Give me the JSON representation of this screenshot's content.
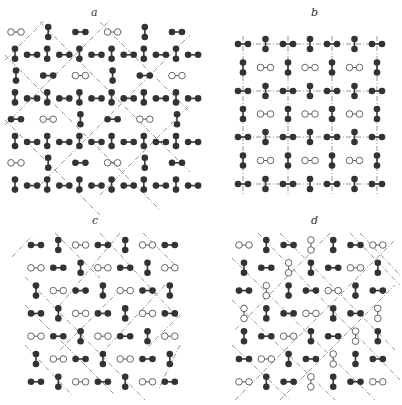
{
  "figure": {
    "width": 402,
    "height": 405,
    "colors": {
      "filled_atom": "#333333",
      "open_atom_stroke": "#555555",
      "dashed_line": "#8a8a8a",
      "background": "#ffffff"
    },
    "atom_radius": 3.3,
    "half_bond": 5,
    "panels": [
      {
        "id": "a",
        "label": "a",
        "label_pos": [
          91,
          16
        ],
        "generator": "pattern_a",
        "origin": [
          16,
          32
        ],
        "step_x": 32.2,
        "step_y": 21.8,
        "cols": 6,
        "rows": 8,
        "dashes": [
          [
            40,
            22,
            190,
            172
          ],
          [
            5,
            55,
            160,
            210
          ],
          [
            5,
            120,
            100,
            215
          ],
          [
            100,
            22,
            190,
            112
          ],
          [
            5,
            60,
            45,
            20
          ],
          [
            5,
            125,
            110,
            20
          ],
          [
            40,
            185,
            190,
            35
          ],
          [
            100,
            195,
            190,
            105
          ],
          [
            5,
            190,
            5,
            190
          ]
        ]
      },
      {
        "id": "b",
        "label": "b",
        "label_pos": [
          311,
          16
        ],
        "generator": "pattern_b",
        "vlines": [
          243,
          288,
          332,
          377
        ],
        "hlines": [
          44,
          91,
          137,
          184
        ],
        "dashes_extent": {
          "x0": 236,
          "x1": 384,
          "y0": 36,
          "y1": 196
        }
      },
      {
        "id": "c",
        "label": "c",
        "label_pos": [
          92,
          224
        ],
        "generator": "pattern_c",
        "origin": [
          36,
          245
        ],
        "step_x": 22.3,
        "step_y": 22.8,
        "cols": 7,
        "rows": 7,
        "dashes": [
          [
            12,
            257,
            33,
            235
          ],
          [
            55,
            233,
            100,
            278
          ],
          [
            100,
            233,
            178,
            318
          ],
          [
            143,
            233,
            178,
            268
          ],
          [
            120,
            233,
            60,
            305
          ],
          [
            25,
            277,
            145,
            400
          ],
          [
            25,
            305,
            115,
            395
          ],
          [
            25,
            345,
            72,
            395
          ],
          [
            165,
            285,
            100,
            355
          ],
          [
            180,
            315,
            145,
            350
          ],
          [
            180,
            345,
            158,
            390
          ],
          [
            60,
            350,
            115,
            295
          ]
        ]
      },
      {
        "id": "d",
        "label": "d",
        "label_pos": [
          311,
          224
        ],
        "generator": "pattern_d",
        "origin": [
          244,
          245
        ],
        "step_x": 22.3,
        "step_y": 22.8,
        "cols": 7,
        "rows": 7,
        "open_vertical_cells": [
          [
            3,
            0
          ],
          [
            2,
            1
          ],
          [
            1,
            2
          ],
          [
            0,
            3
          ],
          [
            6,
            3
          ],
          [
            5,
            4
          ],
          [
            4,
            5
          ],
          [
            3,
            6
          ]
        ],
        "dashes": [
          [
            258,
            233,
            400,
            380
          ],
          [
            280,
            233,
            395,
            350
          ],
          [
            232,
            258,
            375,
            400
          ],
          [
            232,
            300,
            335,
            400
          ],
          [
            232,
            345,
            290,
            400
          ],
          [
            350,
            233,
            400,
            285
          ],
          [
            330,
            233,
            235,
            330
          ],
          [
            360,
            233,
            400,
            275
          ],
          [
            235,
            400,
            395,
            240
          ],
          [
            280,
            400,
            395,
            285
          ]
        ]
      }
    ]
  }
}
